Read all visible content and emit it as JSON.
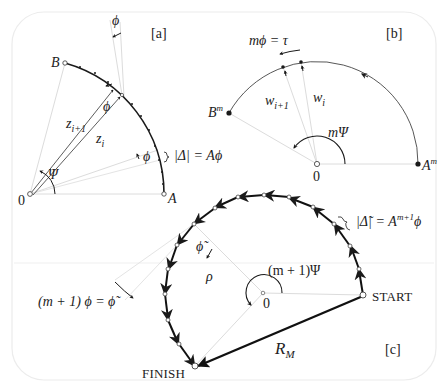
{
  "panels": {
    "a": {
      "tag": "[a]",
      "point_B": "B",
      "point_A": "A",
      "origin": "0",
      "z_next": "z",
      "z_next_sub": "i+1",
      "z_i": "z",
      "z_i_sub": "i",
      "phi_top": "ϕ",
      "phi_mid": "ϕ",
      "phi_low": "ϕ",
      "psi": "Ψ",
      "delta_eq": "|Δ| = Aϕ"
    },
    "b": {
      "tag": "[b]",
      "eq_top": "mϕ = τ",
      "point_Bm": "B",
      "point_Bm_sup": "m",
      "point_Am": "A",
      "point_Am_sup": "m",
      "w_next": "w",
      "w_next_sub": "i+1",
      "w_i": "w",
      "w_i_sub": "i",
      "m_psi": "mΨ",
      "origin": "0"
    },
    "c": {
      "tag": "[c]",
      "start": "START",
      "finish": "FINISH",
      "origin": "0",
      "rho": "ρ",
      "phi_tilde": "ϕ̃",
      "angle_label": "(m + 1)Ψ",
      "delta_eq_left": "|Δ̃| = A",
      "delta_eq_sup": "m+1",
      "delta_eq_right": "ϕ",
      "phi_eq": "(m + 1) ϕ = ϕ̃",
      "radius_label": "R",
      "radius_sub": "M"
    }
  },
  "colors": {
    "ink": "#1a1a1a",
    "faint_line": "#d9d9d9",
    "frame": "#ececec"
  }
}
